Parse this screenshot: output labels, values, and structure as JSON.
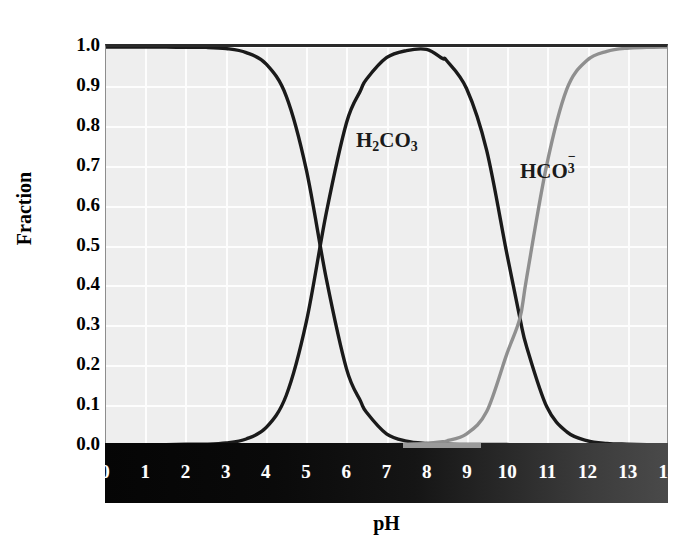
{
  "figure": {
    "background": "#ffffff",
    "plot_background": "#eeeeee",
    "gridline_color": "#fdfdfd"
  },
  "axis": {
    "ylabel": "Fraction",
    "xlabel": "pH",
    "yticks": [
      "1.0",
      "0.9",
      "0.8",
      "0.7",
      "0.6",
      "0.5",
      "0.4",
      "0.3",
      "0.2",
      "0.1",
      "0.0"
    ],
    "xticks": [
      "0",
      "1",
      "2",
      "3",
      "4",
      "5",
      "6",
      "7",
      "8",
      "9",
      "10",
      "11",
      "12",
      "13",
      "14"
    ]
  },
  "labels": {
    "h2co3": {
      "base1": "H",
      "sub1": "2",
      "base2": "CO",
      "sub2": "3",
      "color": "#1a1a1a"
    },
    "hco3": {
      "base1": "HCO",
      "sub": "3",
      "sup": "−",
      "color": "#1a1a1a"
    },
    "co3": {
      "base1": "CO",
      "sub": "3",
      "sup": "2−",
      "color": "#8f8f8f"
    }
  },
  "chart_data": {
    "type": "line",
    "title": "",
    "xlabel": "pH",
    "ylabel": "Fraction",
    "xlim": [
      0,
      14
    ],
    "ylim": [
      0,
      1.0
    ],
    "xticks": [
      0,
      1,
      2,
      3,
      4,
      5,
      6,
      7,
      8,
      9,
      10,
      11,
      12,
      13,
      14
    ],
    "yticks": [
      0.0,
      0.1,
      0.2,
      0.3,
      0.4,
      0.5,
      0.6,
      0.7,
      0.8,
      0.9,
      1.0
    ],
    "grid": true,
    "legend": "inline-annotations",
    "annotations": [
      {
        "text": "H2CO3",
        "x": 4.6,
        "y": 0.87,
        "color": "#1a1a1a"
      },
      {
        "text": "HCO3-",
        "x": 8.6,
        "y": 0.8,
        "color": "#1a1a1a"
      },
      {
        "text": "CO3 2-",
        "x": 12.5,
        "y": 0.87,
        "color": "#8f8f8f"
      }
    ],
    "pka": [
      6.35,
      10.33
    ],
    "x": [
      0,
      0.5,
      1,
      1.5,
      2,
      2.5,
      3,
      3.5,
      4,
      4.5,
      5,
      5.5,
      6,
      6.35,
      6.5,
      7,
      7.5,
      8,
      8.4,
      8.5,
      9,
      9.5,
      10,
      10.33,
      10.5,
      11,
      11.5,
      12,
      12.5,
      13,
      13.5,
      14
    ],
    "series": [
      {
        "name": "H2CO3",
        "color": "#1a1a1a",
        "values": [
          1.0,
          1.0,
          1.0,
          1.0,
          0.999,
          0.999,
          0.996,
          0.986,
          0.957,
          0.876,
          0.691,
          0.416,
          0.191,
          0.11,
          0.0814,
          0.0271,
          0.0087,
          0.0028,
          0.0011,
          0.00088,
          0.00028,
          9e-05,
          3e-05,
          1e-05,
          1e-05,
          0.0,
          0.0,
          0.0,
          0.0,
          0.0,
          0.0,
          0.0
        ]
      },
      {
        "name": "HCO3-",
        "color": "#1a1a1a",
        "values": [
          0.0,
          0.0,
          0.0,
          0.0,
          0.001,
          0.001,
          0.004,
          0.014,
          0.043,
          0.124,
          0.309,
          0.584,
          0.809,
          0.89,
          0.919,
          0.973,
          0.991,
          0.994,
          0.971,
          0.966,
          0.895,
          0.74,
          0.482,
          0.318,
          0.245,
          0.095,
          0.032,
          0.01,
          0.003,
          0.001,
          0.0,
          0.0
        ]
      },
      {
        "name": "CO3 2-",
        "color": "#8f8f8f",
        "values": [
          0.0,
          0.0,
          0.0,
          0.0,
          0.0,
          0.0,
          0.0,
          0.0,
          0.0,
          0.0,
          0.0,
          0.0,
          0.0,
          0.0,
          0.0,
          0.0,
          0.001,
          0.003,
          0.007,
          0.009,
          0.027,
          0.083,
          0.227,
          0.318,
          0.421,
          0.704,
          0.894,
          0.966,
          0.989,
          0.997,
          0.999,
          1.0
        ]
      }
    ]
  }
}
